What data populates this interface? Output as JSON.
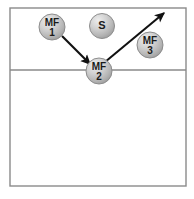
{
  "diagram": {
    "type": "sports-court-play-diagram",
    "canvas": {
      "width": 194,
      "height": 199
    },
    "colors": {
      "background": "#ffffff",
      "court_line": "#8a8a8a",
      "court_fill": "#ffffff",
      "player_fill_light": "#e2e2e2",
      "player_fill_mid": "#b9b9b9",
      "player_fill_dark": "#9a9a9a",
      "player_stroke": "#8d8d8d",
      "player_text": "#1a1a1a",
      "arrow": "#111111"
    },
    "court": {
      "name": "court-outline",
      "x": 10,
      "y": 8,
      "width": 176,
      "height": 178,
      "border_width": 1.4,
      "attack_line": {
        "name": "attack-line",
        "y": 70,
        "x_start": 10,
        "x_end": 186,
        "width": 1.4
      }
    },
    "players": [
      {
        "id": "mf1",
        "name": "player-mf1",
        "role_label": "MF",
        "number_label": "1",
        "display": "MF 1",
        "cx": 52,
        "cy": 27,
        "r": 13
      },
      {
        "id": "s",
        "name": "player-setter",
        "role_label": "S",
        "number_label": "",
        "display": "S",
        "cx": 102,
        "cy": 26,
        "r": 12.5
      },
      {
        "id": "mf2",
        "name": "player-mf2",
        "role_label": "MF",
        "number_label": "2",
        "display": "MF 2",
        "cx": 99,
        "cy": 71,
        "r": 13
      },
      {
        "id": "mf3",
        "name": "player-mf3",
        "role_label": "MF",
        "number_label": "3",
        "display": "MF 3",
        "cx": 150,
        "cy": 45,
        "r": 13
      }
    ],
    "arrows": [
      {
        "id": "arrow-mf1-to-mf2",
        "name": "movement-arrow-mf1-to-mf2",
        "from": "mf1",
        "to": "mf2",
        "x1": 62,
        "y1": 36,
        "x2": 90,
        "y2": 64,
        "head_size": 6.5,
        "stroke_width": 2.1
      },
      {
        "id": "arrow-mf2-to-upper-right",
        "name": "movement-arrow-mf2-to-upper-right",
        "from": "mf2",
        "to": "upper-right-corner",
        "x1": 105,
        "y1": 62,
        "x2": 164,
        "y2": 13,
        "head_size": 7,
        "stroke_width": 2.1
      }
    ]
  }
}
